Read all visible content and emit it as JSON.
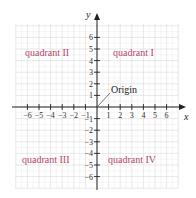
{
  "diagram": {
    "axes": {
      "x_label": "x",
      "y_label": "y",
      "x_ticks": [
        -6,
        -5,
        -4,
        -3,
        -2,
        -1,
        1,
        2,
        3,
        4,
        5,
        6
      ],
      "y_ticks": [
        6,
        5,
        4,
        3,
        2,
        1,
        -1,
        -2,
        -3,
        -4,
        -5,
        -6
      ],
      "x_range": [
        -7,
        7
      ],
      "y_range": [
        -7,
        7
      ]
    },
    "quadrants": [
      {
        "id": "I",
        "label": "quadrant I"
      },
      {
        "id": "II",
        "label": "quadrant II"
      },
      {
        "id": "III",
        "label": "quadrant III"
      },
      {
        "id": "IV",
        "label": "quadrant IV"
      }
    ],
    "origin_label": "Origin",
    "colors": {
      "quadrant_label": "#b5476a",
      "axis": "#222222",
      "grid_major": "#d9d9d9",
      "grid_minor": "#eeeeee"
    }
  }
}
